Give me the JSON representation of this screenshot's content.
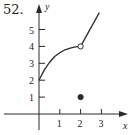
{
  "problem_number": "52.",
  "chart_data": {
    "type": "line",
    "title": "",
    "xlabel": "x",
    "ylabel": "y",
    "xlim": [
      -0.3,
      3.6
    ],
    "ylim": [
      -0.6,
      6.1
    ],
    "x_ticks": [
      1,
      2,
      3
    ],
    "y_ticks": [
      1,
      2,
      3,
      4,
      5
    ],
    "x_tick_labels": [
      "1",
      "2",
      "3"
    ],
    "y_tick_labels": [
      "1",
      "2",
      "3",
      "4",
      "5"
    ],
    "grid": false,
    "legend": null,
    "series": [
      {
        "name": "curve",
        "kind": "concave-down curve",
        "points": [
          [
            0,
            2
          ],
          [
            0.25,
            2.6
          ],
          [
            0.5,
            3.05
          ],
          [
            0.75,
            3.4
          ],
          [
            1,
            3.62
          ],
          [
            1.25,
            3.8
          ],
          [
            1.5,
            3.9
          ],
          [
            1.75,
            3.97
          ],
          [
            2,
            4
          ]
        ]
      },
      {
        "name": "line",
        "kind": "straight segment",
        "points": [
          [
            2,
            4
          ],
          [
            2.9,
            6
          ]
        ]
      }
    ],
    "markers": [
      {
        "x": 2,
        "y": 4,
        "style": "open-circle"
      },
      {
        "x": 2,
        "y": 1,
        "style": "filled-circle"
      }
    ],
    "annotations": []
  }
}
